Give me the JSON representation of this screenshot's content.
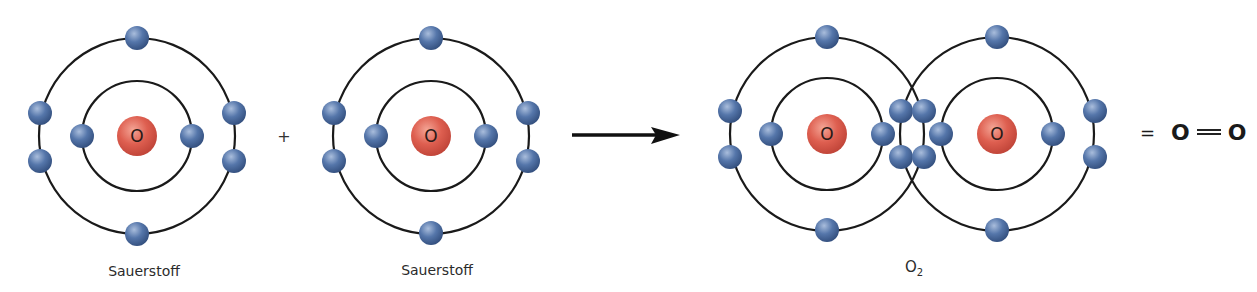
{
  "diagram": {
    "title": "",
    "colors": {
      "orbit": "#1a1a1a",
      "nucleus": "#d9574a",
      "nucleus_highlight": "#f2a090",
      "electron": "#4a6aa0",
      "electron_highlight": "#9fb4d6",
      "text": "#2b2b2b"
    },
    "reactants": [
      {
        "name": "Sauerstoff",
        "symbol": "O",
        "label": "Sauerstoff",
        "center": [
          137,
          136
        ],
        "inner_radius": 55,
        "outer_radius": 98,
        "inner_electrons": 2,
        "outer_electrons": 6
      },
      {
        "name": "Sauerstoff",
        "symbol": "O",
        "label": "Sauerstoff",
        "center": [
          431,
          136
        ],
        "inner_radius": 55,
        "outer_radius": 98,
        "inner_electrons": 2,
        "outer_electrons": 6
      }
    ],
    "operator_plus": "+",
    "arrow": {
      "from": [
        572,
        135
      ],
      "to": [
        680,
        135
      ]
    },
    "product": {
      "formula_main": "O",
      "formula_sub": "2",
      "label": "O₂",
      "atoms": [
        {
          "symbol": "O",
          "center": [
            827,
            134
          ]
        },
        {
          "symbol": "O",
          "center": [
            997,
            134
          ]
        }
      ],
      "inner_radius": 56,
      "outer_radius": 97,
      "shared_electrons": 4
    },
    "structural_formula": {
      "equals": "=",
      "left_atom": "O",
      "bond": "double",
      "right_atom": "O"
    }
  }
}
